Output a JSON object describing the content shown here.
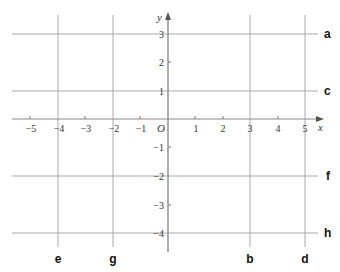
{
  "axes": {
    "x_label": "x",
    "y_label": "y",
    "origin_label": "O",
    "x_ticks": [
      {
        "value": -5,
        "label": "−5"
      },
      {
        "value": -4,
        "label": "−4"
      },
      {
        "value": -3,
        "label": "−3"
      },
      {
        "value": -2,
        "label": "−2"
      },
      {
        "value": -1,
        "label": "−1"
      },
      {
        "value": 1,
        "label": "1"
      },
      {
        "value": 2,
        "label": "2"
      },
      {
        "value": 3,
        "label": "3"
      },
      {
        "value": 4,
        "label": "4"
      },
      {
        "value": 5,
        "label": "5"
      }
    ],
    "y_ticks": [
      {
        "value": 3,
        "label": "3"
      },
      {
        "value": 2,
        "label": "2"
      },
      {
        "value": 1,
        "label": "1"
      },
      {
        "value": -1,
        "label": "−1"
      },
      {
        "value": -2,
        "label": "−2"
      },
      {
        "value": -3,
        "label": "−3"
      },
      {
        "value": -4,
        "label": "−4"
      }
    ],
    "x_range": [
      -5.5,
      5.5
    ],
    "y_range": [
      -4.5,
      3.5
    ]
  },
  "lines": {
    "horizontal": [
      {
        "label": "a",
        "y": 3
      },
      {
        "label": "c",
        "y": 1
      },
      {
        "label": "f",
        "y": -2
      },
      {
        "label": "h",
        "y": -4
      }
    ],
    "vertical": [
      {
        "label": "e",
        "x": -4
      },
      {
        "label": "g",
        "x": -2
      },
      {
        "label": "b",
        "x": 3
      },
      {
        "label": "d",
        "x": 5
      }
    ]
  },
  "colors": {
    "grid_line": "#a8a8a8",
    "axis": "#8a8a8a",
    "text": "#222222"
  }
}
